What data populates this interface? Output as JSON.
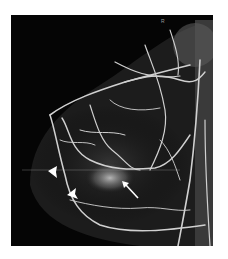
{
  "figure": {
    "corner_label": "R",
    "annotations": [
      {
        "type": "arrowhead",
        "x": 53,
        "y": 172
      },
      {
        "type": "arrowhead",
        "x": 72,
        "y": 194
      },
      {
        "type": "arrow",
        "tip_x": 123,
        "tip_y": 182,
        "tail_x": 138,
        "tail_y": 198
      }
    ],
    "colors": {
      "background": "#ffffff",
      "image_bg": "#050505",
      "vessel": "#d8d8d8",
      "annotation": "#ffffff"
    }
  }
}
